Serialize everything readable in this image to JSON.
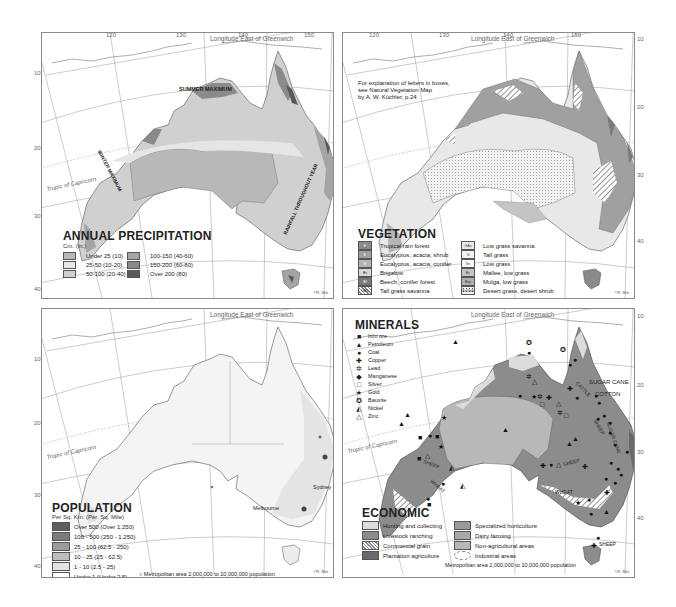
{
  "grid": {
    "longitude_title": "Longitude East of Greenwich",
    "longitude_ticks": [
      "120",
      "130",
      "140",
      "150"
    ],
    "latitude_ticks": [
      "10",
      "20",
      "30",
      "40"
    ],
    "tropic_label": "Tropic of Capricorn",
    "credit": "©R. Mitt."
  },
  "colors": {
    "land_light": "#e4e4e4",
    "land_mid": "#c8c8c8",
    "land_dark": "#9a9a9a",
    "land_darker": "#787878",
    "land_darkest": "#555555",
    "frame": "#8a8a8a"
  },
  "precipitation": {
    "title": "ANNUAL PRECIPITATION",
    "subtitle": "Cm. (In.)",
    "legend": [
      {
        "label": "Under 25 (10)",
        "color": "#b8b8b8"
      },
      {
        "label": "25-50 (10-20)",
        "color": "#e6e6e6"
      },
      {
        "label": "50-100 (20-40)",
        "color": "#d0d0d0"
      },
      {
        "label": "100-150 (40-60)",
        "color": "#a4a4a4"
      },
      {
        "label": "150-200 (60-80)",
        "color": "#8a8a8a"
      },
      {
        "label": "Over 200 (80)",
        "color": "#5a5a5a"
      }
    ],
    "labels": [
      "SUMMER MAXIMUM",
      "WINTER MAXIMUM",
      "RAINFALL THROUGHOUT YEAR"
    ]
  },
  "vegetation": {
    "title": "VEGETATION",
    "note": "For explanation of letters in boxes,\nsee Natural Vegetation Map\nby A. W. Küchler, p.24",
    "legend": [
      {
        "code": "E",
        "label": "Tropical rain forest",
        "color": "#8a8a8a"
      },
      {
        "code": "E",
        "label": "Eucalyptus, acacia, shrub",
        "color": "#a0a0a0"
      },
      {
        "code": "E",
        "label": "Eucalyptus, acacia, conifer",
        "color": "#b4b4b4"
      },
      {
        "code": "Bs",
        "label": "Brigalow",
        "color": "#d8d8d8"
      },
      {
        "code": "Bf",
        "label": "Beech, conifer forest",
        "color": "#7a7a7a"
      },
      {
        "code": "GBs",
        "label": "Tall grass savanna",
        "color": "hatch"
      },
      {
        "code": "GAs",
        "label": "Low grass savanna",
        "color": "#e8e8e8"
      },
      {
        "code": "G",
        "label": "Tall grass",
        "color": "#f2f2f2"
      },
      {
        "code": "Gs",
        "label": "Low grass",
        "color": "#fafafa"
      },
      {
        "code": "Bs",
        "label": "Mallee, low grass",
        "color": "#c4c4c4"
      },
      {
        "code": "Bsp",
        "label": "Mulga, low grass",
        "color": "#b0b0b0"
      },
      {
        "code": "Ks/Gsb",
        "label": "Desert grass, desert shrub",
        "color": "dots"
      }
    ]
  },
  "population": {
    "title": "POPULATION",
    "subtitle": "Per Sq. Km. (Per. Sq. Mile)",
    "legend": [
      {
        "label": "Over 500 (Over 1,250)",
        "color": "#5e5e5e"
      },
      {
        "label": "100 - 500 (250 - 1,250)",
        "color": "#7c7c7c"
      },
      {
        "label": "25 - 100 (62.5 - 250)",
        "color": "#9c9c9c"
      },
      {
        "label": "10 - 25 (25 - 62.5)",
        "color": "#bdbdbd"
      },
      {
        "label": "1 - 10 (2.5 - 25)",
        "color": "#e2e2e2"
      },
      {
        "label": "Under 1 (Under 2.5)",
        "color": "#ffffff"
      }
    ],
    "metro_note": "○ Metropolitan area 2,000,000 to 10,000,000 population",
    "cities": [
      "Sydney",
      "Melbourne"
    ]
  },
  "minerals": {
    "title": "MINERALS",
    "legend": [
      {
        "symbol": "■",
        "label": "Iron ore"
      },
      {
        "symbol": "▲",
        "label": "Petroleum"
      },
      {
        "symbol": "●",
        "label": "Coal"
      },
      {
        "symbol": "✚",
        "label": "Copper"
      },
      {
        "symbol": "✲",
        "label": "Lead"
      },
      {
        "symbol": "◆",
        "label": "Manganese"
      },
      {
        "symbol": "□",
        "label": "Silver"
      },
      {
        "symbol": "★",
        "label": "Gold"
      },
      {
        "symbol": "✪",
        "label": "Bauxite"
      },
      {
        "symbol": "◭",
        "label": "Nickel"
      },
      {
        "symbol": "△",
        "label": "Zinc"
      }
    ]
  },
  "economic": {
    "title": "ECONOMIC",
    "legend": [
      {
        "label": "Hunting and collecting",
        "color": "#dcdcdc"
      },
      {
        "label": "Livestock ranching",
        "color": "#8c8c8c"
      },
      {
        "label": "Commercial grain",
        "color": "hatch"
      },
      {
        "label": "Plantation agriculture",
        "color": "#6a6a6a"
      },
      {
        "label": "Specialized horticulture",
        "color": "#9a9a9a"
      },
      {
        "label": "Dairy farming",
        "color": "#a8a8a8"
      },
      {
        "label": "Non-agricultural areas",
        "color": "#b8b8b8"
      },
      {
        "label": "Industrial areas",
        "color": "dashed"
      }
    ],
    "metro_note": "Metropolitan area 2,000,000 to 10,000,000 population",
    "map_labels": [
      "SUGAR CANE",
      "COTTON",
      "CATTLE",
      "SHEEP",
      "WHEAT",
      "DAIRY",
      "SUGAR CANE"
    ]
  }
}
